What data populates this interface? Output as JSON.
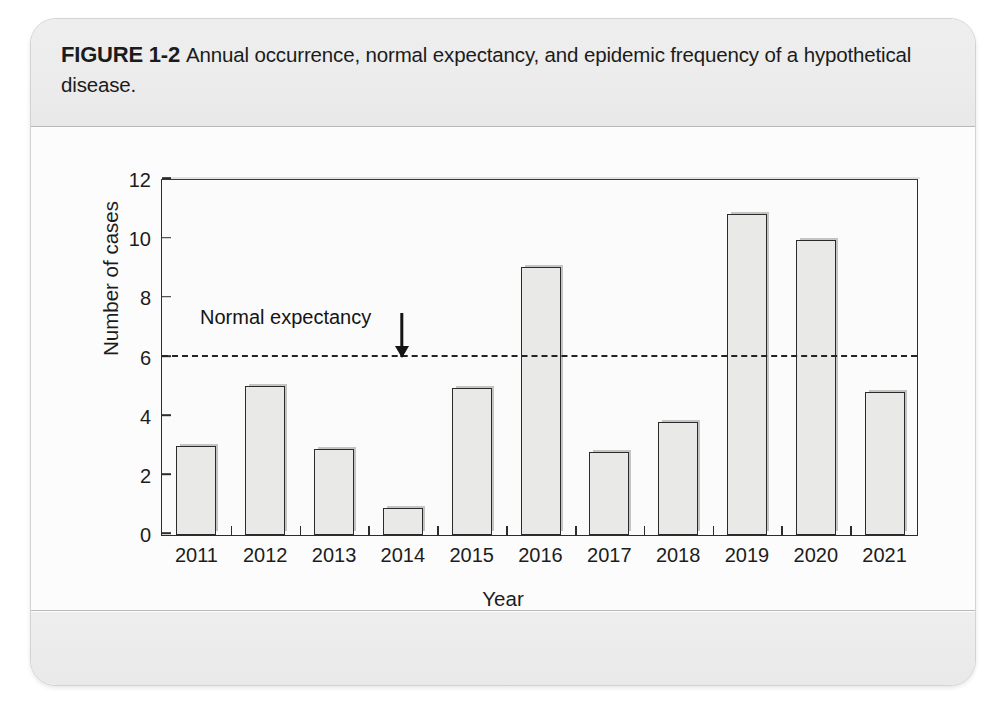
{
  "figure": {
    "label": "FIGURE 1-2",
    "caption": "Annual occurrence, normal expectancy, and epidemic frequency of a hypothetical disease."
  },
  "chart_data": {
    "type": "bar",
    "title": "",
    "xlabel": "Year",
    "ylabel": "Number of cases",
    "categories": [
      "2011",
      "2012",
      "2013",
      "2014",
      "2015",
      "2016",
      "2017",
      "2018",
      "2019",
      "2020",
      "2021"
    ],
    "values": [
      3.0,
      5.0,
      2.9,
      0.9,
      4.95,
      9.0,
      2.8,
      3.8,
      10.8,
      9.9,
      4.8
    ],
    "ylim": [
      0,
      12
    ],
    "yticks": [
      0,
      2,
      4,
      6,
      8,
      10,
      12
    ],
    "ytick_labels": [
      "0",
      "2",
      "4",
      "6",
      "8",
      "10",
      "12"
    ],
    "grid": false,
    "legend": "none",
    "annotations": [
      {
        "name": "normal-expectancy",
        "label": "Normal expectancy",
        "value": 6,
        "style": "dashed-horizontal-line-with-arrow"
      }
    ],
    "colors": {
      "bar_fill": "#e9e9e7",
      "bar_border": "#2b2b2b",
      "axis": "#2c2c2c",
      "annotation": "#141414"
    }
  }
}
